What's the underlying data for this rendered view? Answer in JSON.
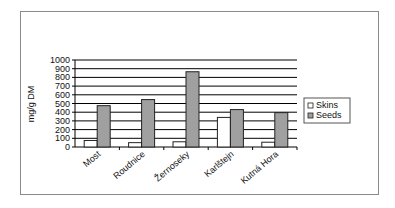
{
  "chart_data": {
    "type": "bar",
    "title": "",
    "xlabel": "",
    "ylabel": "mg/g DM",
    "ylim": [
      0,
      1000
    ],
    "yticks": [
      0,
      100,
      200,
      300,
      400,
      500,
      600,
      700,
      800,
      900,
      1000
    ],
    "grid": true,
    "legend_position": "right",
    "categories": [
      "Most",
      "Roudnice",
      "Žernoseky",
      "Karlštejn",
      "Kutná Hora"
    ],
    "series": [
      {
        "name": "Skins",
        "color": "#ffffff",
        "values": [
          75,
          50,
          60,
          340,
          55
        ]
      },
      {
        "name": "Seeds",
        "color": "#a0a0a0",
        "values": [
          475,
          545,
          865,
          430,
          395
        ]
      }
    ]
  }
}
